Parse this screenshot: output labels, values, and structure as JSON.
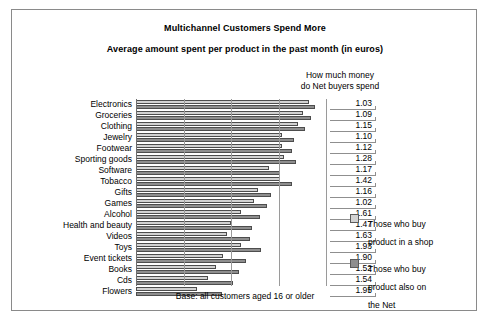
{
  "titles": {
    "line1": "Multichannel Customers Spend More",
    "line2": "Average amount spent per product in the past month (in euros)"
  },
  "column_header": "How much money\ndo Net buyers spend",
  "footer": "Base: all customers aged 16 or older",
  "legend": {
    "items": [
      {
        "key": "shop",
        "label": "Those who buy\nproduct in a shop",
        "color": "#d2d2d2"
      },
      {
        "key": "net",
        "label": "Those who buy\nproduct also on\nthe Net",
        "color": "#8e8e8e"
      }
    ]
  },
  "chart_data": {
    "type": "bar",
    "orientation": "horizontal",
    "grouping": "grouped",
    "title": "Multichannel Customers Spend More",
    "subtitle": "Average amount spent per product in the past month (in euros)",
    "xlabel": "",
    "ylabel": "",
    "grid": true,
    "legend_position": "right",
    "xlim": [
      0,
      100
    ],
    "categories": [
      "Electronics",
      "Groceries",
      "Clothing",
      "Jewelry",
      "Footwear",
      "Sporting goods",
      "Software",
      "Tobacco",
      "Gifts",
      "Games",
      "Alcohol",
      "Health and beauty",
      "Videos",
      "Toys",
      "Event tickets",
      "Books",
      "Cds",
      "Flowers"
    ],
    "series": [
      {
        "name": "Those who buy product in a shop",
        "color": "#d2d2d2",
        "values": [
          91,
          88,
          85,
          77,
          77,
          78,
          70,
          76,
          64,
          62,
          55,
          50,
          48,
          55,
          46,
          42,
          38,
          32
        ]
      },
      {
        "name": "Those who buy product also on the Net",
        "color": "#8e8e8e",
        "values": [
          94,
          92,
          89,
          83,
          82,
          84,
          76,
          82,
          71,
          69,
          65,
          61,
          60,
          66,
          58,
          54,
          51,
          45
        ]
      }
    ],
    "ratio_label_header": "How much money do Net buyers spend",
    "ratios": [
      "1.03",
      "1.09",
      "1.15",
      "1.10",
      "1.12",
      "1.28",
      "1.17",
      "1.42",
      "1.16",
      "1.02",
      "1.61",
      "1.47",
      "1.63",
      "1.93",
      "1.90",
      "1.52",
      "1.54",
      "1.95"
    ],
    "annotation": "Base: all customers aged 16 or older"
  }
}
